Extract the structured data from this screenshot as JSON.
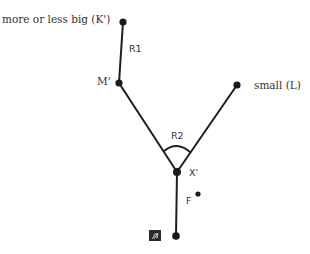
{
  "diagram": {
    "nodes": {
      "k_prime": {
        "label": "more or less big (K')",
        "x": 123,
        "y": 22
      },
      "m_prime": {
        "label": "M'",
        "x": 119,
        "y": 83
      },
      "l": {
        "label": "small (L)",
        "x": 237,
        "y": 85
      },
      "x_prime": {
        "label": "X'",
        "x": 177,
        "y": 172
      },
      "f": {
        "label": "F",
        "x": 198,
        "y": 194
      },
      "bottom": {
        "label": "",
        "x": 176,
        "y": 236
      }
    },
    "edges": [
      {
        "from": "k_prime",
        "to": "m_prime",
        "label": "R1"
      },
      {
        "from": "m_prime",
        "to": "x_prime",
        "label": ""
      },
      {
        "from": "l",
        "to": "x_prime",
        "label": ""
      },
      {
        "from": "x_prime",
        "to": "bottom",
        "label": ""
      }
    ],
    "angle_label": "R2",
    "icon": {
      "name": "hatched-square-icon",
      "glyph": "//i"
    },
    "colors": {
      "line": "#1e1e1e",
      "node": "#1a1a1a",
      "text": "#333333",
      "background": "#ffffff"
    }
  }
}
